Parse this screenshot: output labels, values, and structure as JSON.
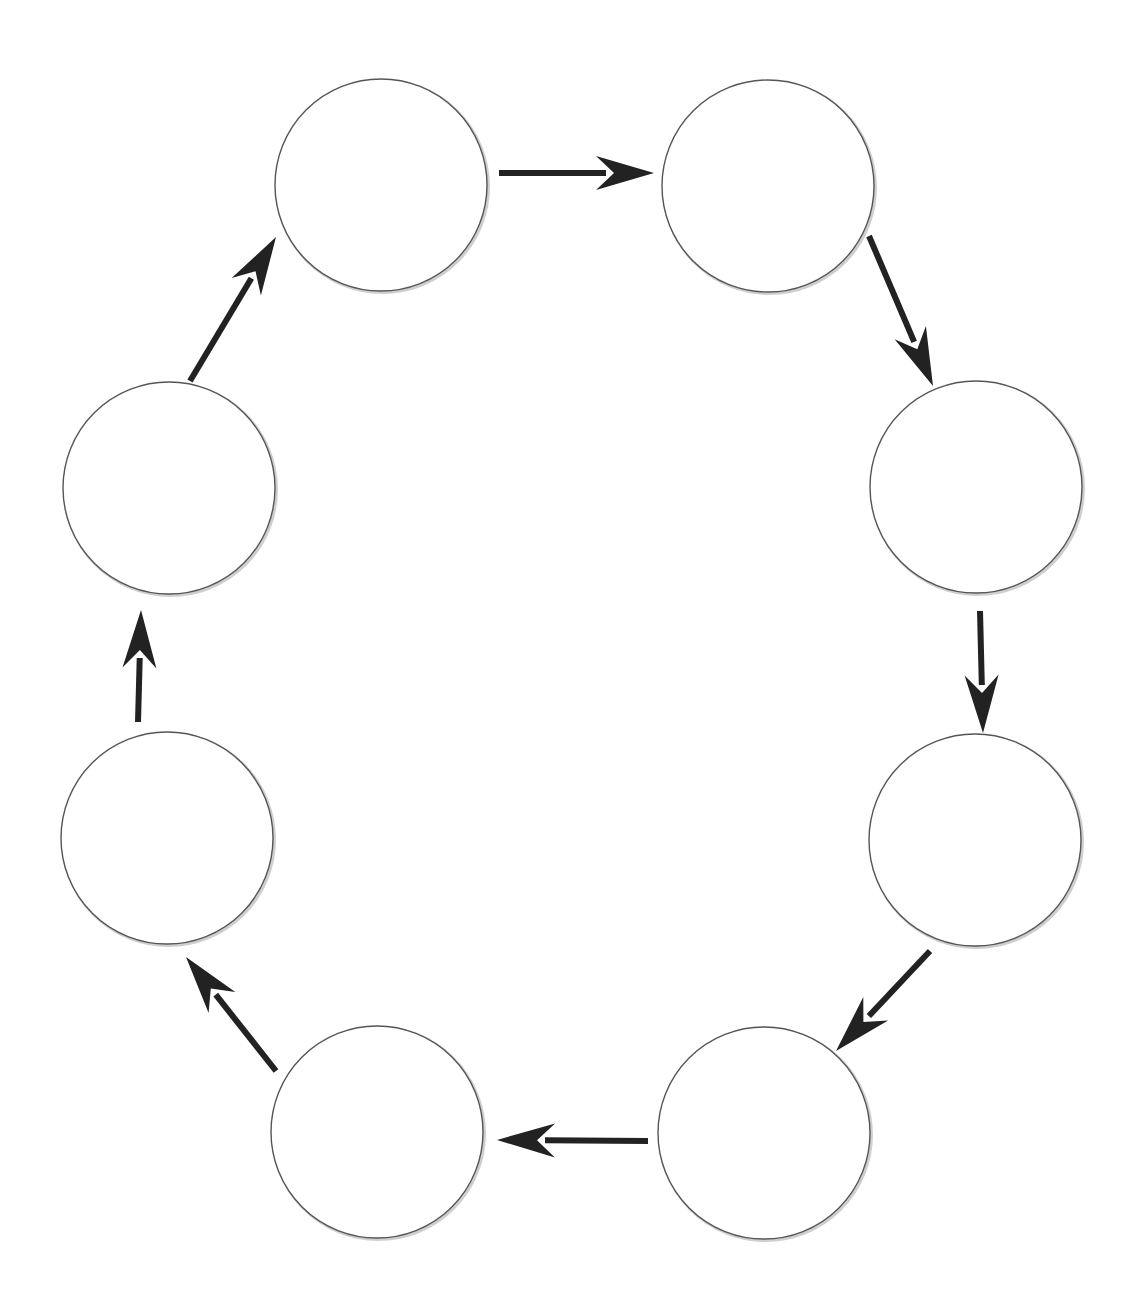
{
  "diagram": {
    "type": "cycle",
    "direction": "clockwise",
    "colors": {
      "background": "#ffffff",
      "circle_stroke": "#555555",
      "arrow": "#222222"
    },
    "node_radius": 106,
    "nodes": [
      {
        "id": "n1",
        "label": "",
        "cx": 381,
        "cy": 185
      },
      {
        "id": "n2",
        "label": "",
        "cx": 768,
        "cy": 186
      },
      {
        "id": "n3",
        "label": "",
        "cx": 976,
        "cy": 487
      },
      {
        "id": "n4",
        "label": "",
        "cx": 975,
        "cy": 840
      },
      {
        "id": "n5",
        "label": "",
        "cx": 764,
        "cy": 1133
      },
      {
        "id": "n6",
        "label": "",
        "cx": 377,
        "cy": 1132
      },
      {
        "id": "n7",
        "label": "",
        "cx": 167,
        "cy": 838
      },
      {
        "id": "n8",
        "label": "",
        "cx": 169,
        "cy": 488
      }
    ],
    "arrows": [
      {
        "from": "n1",
        "to": "n2",
        "x1": 499,
        "y1": 173,
        "x2": 654,
        "y2": 173
      },
      {
        "from": "n2",
        "to": "n3",
        "x1": 869,
        "y1": 236,
        "x2": 933,
        "y2": 386
      },
      {
        "from": "n3",
        "to": "n4",
        "x1": 980,
        "y1": 611,
        "x2": 983,
        "y2": 733
      },
      {
        "from": "n4",
        "to": "n5",
        "x1": 930,
        "y1": 951,
        "x2": 836,
        "y2": 1051
      },
      {
        "from": "n5",
        "to": "n6",
        "x1": 648,
        "y1": 1141,
        "x2": 497,
        "y2": 1140
      },
      {
        "from": "n6",
        "to": "n7",
        "x1": 276,
        "y1": 1071,
        "x2": 186,
        "y2": 957
      },
      {
        "from": "n7",
        "to": "n8",
        "x1": 138,
        "y1": 722,
        "x2": 141,
        "y2": 610
      },
      {
        "from": "n8",
        "to": "n1",
        "x1": 190,
        "y1": 381,
        "x2": 276,
        "y2": 237
      }
    ]
  }
}
